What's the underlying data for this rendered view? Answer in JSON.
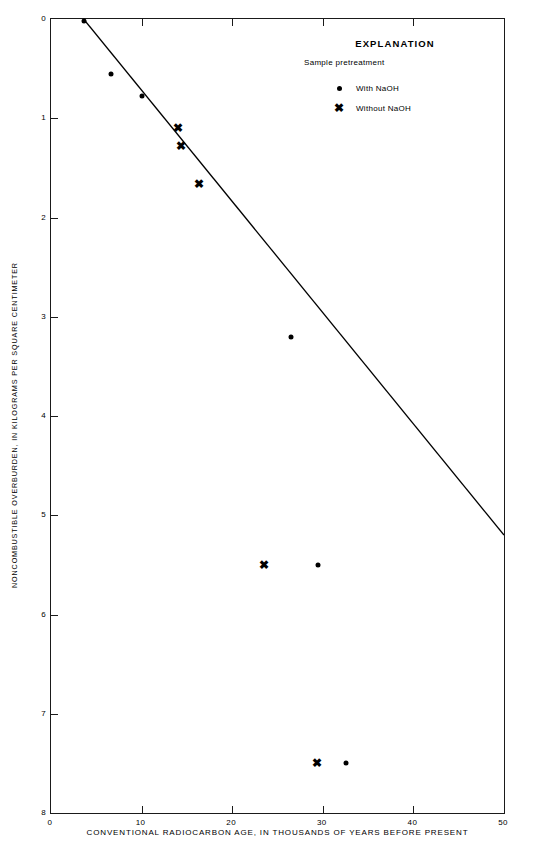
{
  "chart_data": {
    "type": "scatter",
    "title": "",
    "xlabel": "CONVENTIONAL RADIOCARBON AGE, IN THOUSANDS OF YEARS BEFORE PRESENT",
    "ylabel": "NONCOMBUSTIBLE OVERBURDEN, IN KILOGRAMS PER SQUARE CENTIMETER",
    "xlim": [
      0,
      50
    ],
    "ylim": [
      0,
      8
    ],
    "y_axis_inverted": true,
    "grid": false,
    "xticks": [
      0,
      10,
      20,
      30,
      40,
      50
    ],
    "xticklabels": [
      "0",
      "10",
      "20",
      "30",
      "40",
      "50"
    ],
    "yticks": [
      0,
      1,
      2,
      3,
      4,
      5,
      6,
      7,
      8
    ],
    "yticklabels": [
      "0",
      "1",
      "2",
      "3",
      "4",
      "5",
      "6",
      "7",
      "8"
    ],
    "series": [
      {
        "name": "With NaOH",
        "marker": "dot",
        "points": [
          {
            "x": 3.6,
            "y": 0.02
          },
          {
            "x": 6.6,
            "y": 0.55
          },
          {
            "x": 10.0,
            "y": 0.78
          },
          {
            "x": 26.5,
            "y": 3.2
          },
          {
            "x": 29.5,
            "y": 5.5
          },
          {
            "x": 32.6,
            "y": 7.5
          }
        ]
      },
      {
        "name": "Without NaOH",
        "marker": "x",
        "points": [
          {
            "x": 14.0,
            "y": 1.1
          },
          {
            "x": 14.4,
            "y": 1.28
          },
          {
            "x": 16.3,
            "y": 1.66
          },
          {
            "x": 23.5,
            "y": 5.5
          },
          {
            "x": 29.4,
            "y": 7.5
          }
        ]
      }
    ],
    "fit_line": {
      "name": "regression-line",
      "x_start": 3.6,
      "y_start": 0.0,
      "x_end": 50.0,
      "y_end": 5.2
    }
  },
  "legend": {
    "title": "EXPLANATION",
    "subtitle": "Sample pretreatment",
    "position": "upper-right-inset",
    "entries": [
      {
        "symbol": "●",
        "label": "With NaOH"
      },
      {
        "symbol": "✖",
        "label": "Without NaOH"
      }
    ]
  },
  "axes": {
    "x_title": "CONVENTIONAL RADIOCARBON AGE, IN THOUSANDS OF YEARS BEFORE PRESENT",
    "y_title": "NONCOMBUSTIBLE OVERBURDEN, IN KILOGRAMS PER SQUARE CENTIMETER"
  },
  "colors": {
    "axis": "#1a1a1a",
    "marker": "#000000",
    "line": "#000000",
    "background": "#ffffff"
  }
}
